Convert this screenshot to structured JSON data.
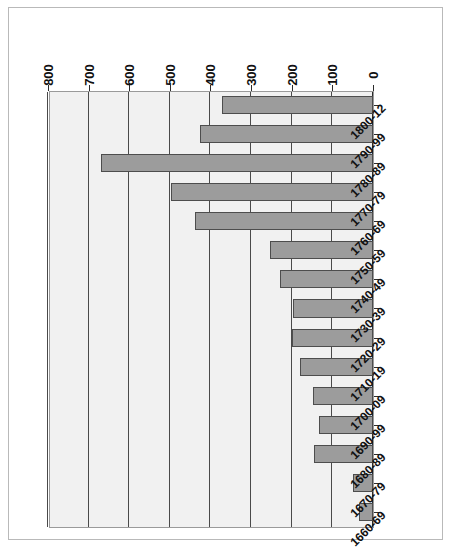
{
  "chart_data": {
    "type": "bar",
    "orientation": "horizontal",
    "title": "",
    "subtitle": "",
    "xlabel": "",
    "ylabel": "",
    "categories": [
      "1660-69",
      "1670-79",
      "1680-89",
      "1690-99",
      "1700-09",
      "1710-19",
      "1720-29",
      "1730-39",
      "1740-49",
      "1750-59",
      "1760-69",
      "1770-79",
      "1780-89",
      "1790-99",
      "1800-12"
    ],
    "values": [
      34,
      50,
      146,
      132,
      148,
      180,
      200,
      196,
      230,
      254,
      437,
      496,
      669,
      426,
      372
    ],
    "value_axis_ticks": [
      0,
      100,
      200,
      300,
      400,
      500,
      600,
      700,
      800
    ],
    "value_axis_tick_labels": [
      "0",
      "100",
      "200",
      "300",
      "400",
      "500",
      "600",
      "700",
      "800"
    ],
    "xlim": [
      0,
      800
    ],
    "grid": true,
    "legend": false,
    "legend_entries": [],
    "annotations": [],
    "bar_color": "#9c9c9c",
    "bar_border_color": "#4d4d4d",
    "plot_background": "#f1f1f1",
    "gridline_color": "#4a4a4a",
    "page_background": "#ffffff",
    "frame_border_color": "#b9b9b9",
    "rotation_degrees": 180
  }
}
